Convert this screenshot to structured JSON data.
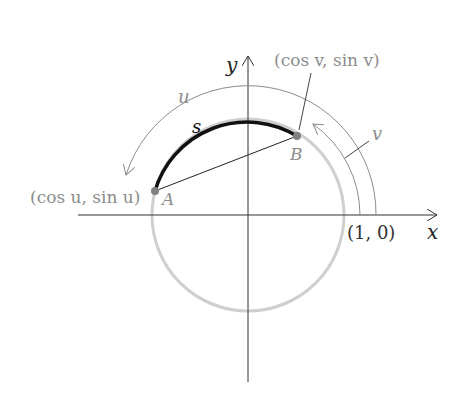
{
  "diagram": {
    "type": "unit-circle-arc-length",
    "axes": {
      "x_label": "x",
      "y_label": "y"
    },
    "points": {
      "A": {
        "label": "A",
        "coords": "(cos u, sin u)"
      },
      "B": {
        "label": "B",
        "coords": "(cos v, sin v)"
      },
      "one_zero": "(1, 0)"
    },
    "arcs": {
      "u": "u",
      "v": "v",
      "s": "s"
    },
    "colors": {
      "gray": "#8c8c8c",
      "light_gray": "#c8c8c8",
      "black": "#111111",
      "point": "#808080"
    }
  }
}
